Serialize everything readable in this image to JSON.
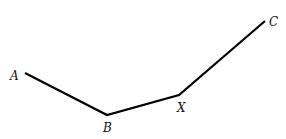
{
  "diagram": {
    "type": "polyline",
    "stroke_color": "#000000",
    "background": "#ffffff",
    "points": [
      {
        "name": "A",
        "x": 25,
        "y": 73,
        "label": "A",
        "label_x": 10,
        "label_y": 80
      },
      {
        "name": "B",
        "x": 107,
        "y": 115,
        "label": "B",
        "label_x": 103,
        "label_y": 132
      },
      {
        "name": "X",
        "x": 179,
        "y": 95,
        "label": "X",
        "label_x": 177,
        "label_y": 112
      },
      {
        "name": "C",
        "x": 265,
        "y": 21,
        "label": "C",
        "label_x": 269,
        "label_y": 26
      }
    ],
    "labels": {
      "A": "A",
      "B": "B",
      "X": "X",
      "C": "C"
    }
  }
}
